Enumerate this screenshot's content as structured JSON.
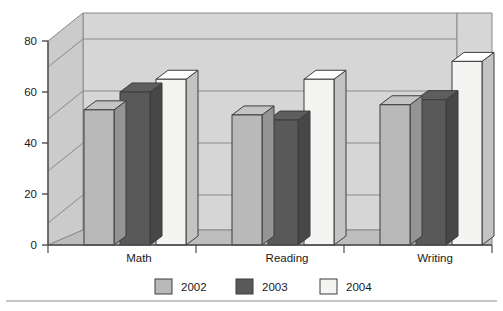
{
  "chart_data": {
    "type": "bar",
    "title": "",
    "subtitle": "",
    "xlabel": "",
    "ylabel": "",
    "categories": [
      "Math",
      "Reading",
      "Writing"
    ],
    "series": [
      {
        "name": "2002",
        "color": "#b9b9b9",
        "values": [
          53,
          51,
          55
        ]
      },
      {
        "name": "2003",
        "color": "#595959",
        "values": [
          60,
          49,
          57
        ]
      },
      {
        "name": "2004",
        "color": "#f4f4f2",
        "values": [
          65,
          65,
          72
        ]
      }
    ],
    "ylim": [
      0,
      80
    ],
    "yticks": [
      0,
      20,
      40,
      60,
      80
    ],
    "ytick_labels": [
      "0",
      "20",
      "40",
      "60",
      "80"
    ],
    "grid": true,
    "legend_position": "bottom",
    "style": "3d-column",
    "annotations": []
  },
  "colors": {
    "plot_back_wall": "#d6d6d6",
    "plot_side_wall": "#cfcfcf",
    "plot_floor": "#bfbfbf",
    "gridline": "#7d7d7d",
    "axis_line": "#4d4d4d",
    "bar_outline": "#3d3d3d",
    "divider": "#8c8c8c",
    "background": "#ffffff"
  },
  "axis": {
    "y_tick_0": "0",
    "y_tick_20": "20",
    "y_tick_40": "40",
    "y_tick_60": "60",
    "y_tick_80": "80"
  },
  "legend": {
    "items": [
      {
        "label": "2002",
        "swatch": "#b9b9b9"
      },
      {
        "label": "2003",
        "swatch": "#595959"
      },
      {
        "label": "2004",
        "swatch": "#f4f4f2"
      }
    ]
  }
}
